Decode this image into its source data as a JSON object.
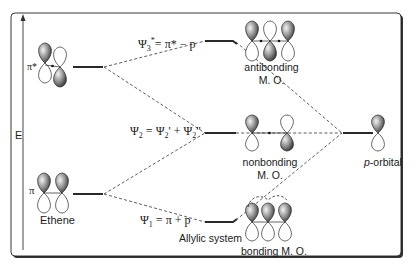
{
  "diagram": {
    "axis": {
      "label": "E",
      "direction": "up"
    },
    "left_fragment": {
      "name": "Ethene",
      "levels": [
        {
          "id": "pi_star",
          "label": "π*",
          "level": "high"
        },
        {
          "id": "pi",
          "label": "π",
          "level": "low"
        }
      ]
    },
    "right_fragment": {
      "name": "p-orbital",
      "name_italic": "p",
      "name_rest": "-orbital"
    },
    "combined": {
      "system_label": "Allylic system",
      "mos": [
        {
          "id": "psi3",
          "equation_psi": "Ψ",
          "equation_sub": "3",
          "equation_sup": "*",
          "equation_rest": "= π* − p",
          "name_line1": "antibonding",
          "name_line2": "M. O."
        },
        {
          "id": "psi2",
          "equation_psi": "Ψ",
          "equation_sub": "2",
          "equation_rest1": " = Ψ",
          "equation_sub2": "2",
          "equation_rest2": "' + Ψ",
          "equation_sub3": "2",
          "equation_rest3": "''",
          "name_line1": "nonbonding",
          "name_line2": "M. O."
        },
        {
          "id": "psi1",
          "equation_psi": "Ψ",
          "equation_sub": "1",
          "equation_rest": " = π + p",
          "name_line1": "bonding M. O."
        }
      ]
    },
    "colors": {
      "frame": "#222222",
      "lines": "#2a2a2a",
      "lobe_shaded_dark": "#3a3a3a",
      "lobe_shaded_light": "#e8e8e8",
      "lobe_empty": "#ffffff"
    }
  }
}
